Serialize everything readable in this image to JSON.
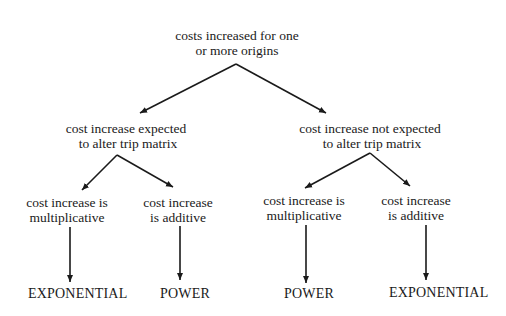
{
  "diagram": {
    "type": "decision-tree",
    "root": {
      "line1": "costs increased for one",
      "line2": "or more origins"
    },
    "branches": [
      {
        "line1": "cost increase expected",
        "line2": "to alter trip matrix",
        "children": [
          {
            "line1": "cost increase is",
            "line2": "multiplicative",
            "result": "EXPONENTIAL"
          },
          {
            "line1": "cost increase",
            "line2": "is additive",
            "result": "POWER"
          }
        ]
      },
      {
        "line1": "cost increase not expected",
        "line2": "to alter trip matrix",
        "children": [
          {
            "line1": "cost increase is",
            "line2": "multiplicative",
            "result": "POWER"
          },
          {
            "line1": "cost increase",
            "line2": "is additive",
            "result": "EXPONENTIAL"
          }
        ]
      }
    ],
    "colors": {
      "background": "#ffffff",
      "ink": "#1a1a1a"
    }
  }
}
